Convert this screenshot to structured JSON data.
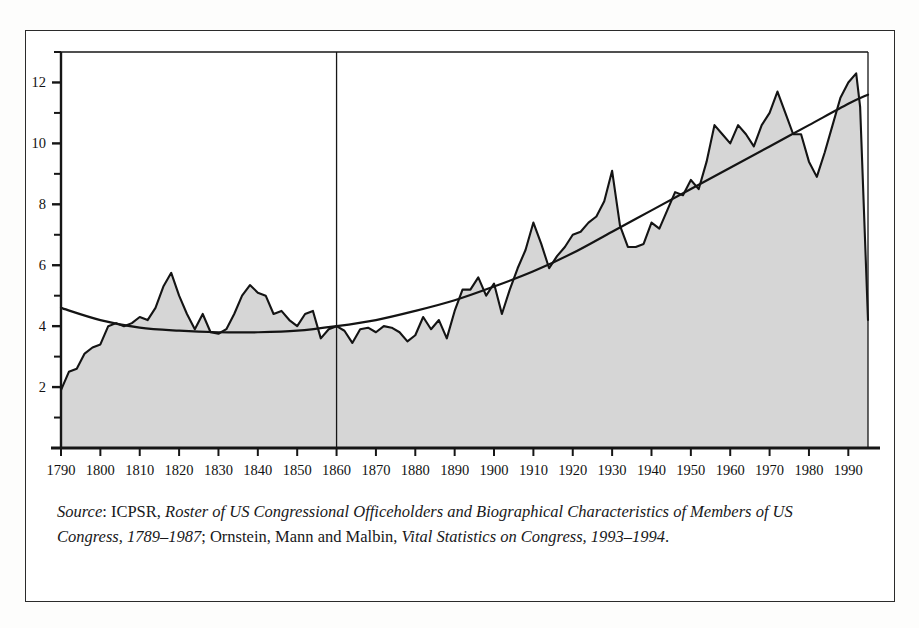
{
  "figure": {
    "caption_source_label": "Source",
    "caption_text_1": ": ICPSR, ",
    "caption_italic_1": "Roster of US Congressional Officeholders and Biographical Characteristics of Members of US Congress, 1789–1987",
    "caption_text_2": "; Ornstein, Mann and Malbin, ",
    "caption_italic_2": "Vital Statistics on Congress, 1993–1994",
    "caption_text_3": "."
  },
  "colors": {
    "area_fill": "#d6d6d6",
    "line": "#141414",
    "frame": "#2b2b2b",
    "page_background": "#ffffff"
  },
  "chart_data": {
    "type": "area",
    "title": "",
    "subtitle": "",
    "xlabel": "",
    "ylabel": "",
    "xlim": [
      1790,
      1995
    ],
    "ylim": [
      0,
      13
    ],
    "grid": false,
    "legend": "none",
    "x_ticks": [
      1790,
      1800,
      1810,
      1820,
      1830,
      1840,
      1850,
      1860,
      1870,
      1880,
      1890,
      1900,
      1910,
      1920,
      1930,
      1940,
      1950,
      1960,
      1970,
      1980,
      1990
    ],
    "x_tick_labels": [
      "1790",
      "1800",
      "1810",
      "1820",
      "1830",
      "1840",
      "1850",
      "1860",
      "1870",
      "1880",
      "1890",
      "1900",
      "1910",
      "1920",
      "1930",
      "1940",
      "1950",
      "1960",
      "1970",
      "1980",
      "1990"
    ],
    "y_ticks": [
      2,
      4,
      6,
      8,
      10,
      12
    ],
    "y_tick_labels": [
      "2",
      "4",
      "6",
      "8",
      "10",
      "12"
    ],
    "y_minor_ticks": [
      1,
      3,
      5,
      7,
      9,
      11,
      13
    ],
    "annotations": [
      {
        "type": "vertical-line",
        "x": 1860,
        "label": "1860 reference line"
      }
    ],
    "series": [
      {
        "name": "Mean years of service",
        "style": "filled-area-with-line",
        "x": [
          1790,
          1792,
          1794,
          1796,
          1798,
          1800,
          1802,
          1804,
          1806,
          1808,
          1810,
          1812,
          1814,
          1816,
          1818,
          1820,
          1822,
          1824,
          1826,
          1828,
          1830,
          1832,
          1834,
          1836,
          1838,
          1840,
          1842,
          1844,
          1846,
          1848,
          1850,
          1852,
          1854,
          1856,
          1858,
          1860,
          1862,
          1864,
          1866,
          1868,
          1870,
          1872,
          1874,
          1876,
          1878,
          1880,
          1882,
          1884,
          1886,
          1888,
          1890,
          1892,
          1894,
          1896,
          1898,
          1900,
          1902,
          1904,
          1906,
          1908,
          1910,
          1912,
          1914,
          1916,
          1918,
          1920,
          1922,
          1924,
          1926,
          1928,
          1930,
          1932,
          1934,
          1936,
          1938,
          1940,
          1942,
          1944,
          1946,
          1948,
          1950,
          1952,
          1954,
          1956,
          1958,
          1960,
          1962,
          1964,
          1966,
          1968,
          1970,
          1972,
          1974,
          1976,
          1978,
          1980,
          1982,
          1984,
          1986,
          1988,
          1990,
          1992,
          1993,
          1995
        ],
        "values": [
          1.9,
          2.5,
          2.6,
          3.1,
          3.3,
          3.4,
          4.0,
          4.1,
          4.0,
          4.1,
          4.3,
          4.2,
          4.6,
          5.3,
          5.75,
          5.0,
          4.4,
          3.9,
          4.4,
          3.8,
          3.75,
          3.9,
          4.4,
          5.0,
          5.35,
          5.1,
          5.0,
          4.4,
          4.5,
          4.2,
          4.0,
          4.4,
          4.5,
          3.6,
          3.9,
          4.0,
          3.85,
          3.45,
          3.9,
          3.95,
          3.8,
          4.0,
          3.95,
          3.8,
          3.5,
          3.7,
          4.3,
          3.9,
          4.2,
          3.6,
          4.5,
          5.2,
          5.2,
          5.6,
          5.0,
          5.4,
          4.4,
          5.2,
          5.9,
          6.5,
          7.4,
          6.7,
          5.9,
          6.3,
          6.6,
          7.0,
          7.1,
          7.4,
          7.6,
          8.1,
          9.1,
          7.3,
          6.6,
          6.6,
          6.7,
          7.4,
          7.2,
          7.8,
          8.4,
          8.3,
          8.8,
          8.5,
          9.4,
          10.6,
          10.3,
          10.0,
          10.6,
          10.3,
          9.9,
          10.6,
          11.0,
          11.7,
          11.0,
          10.3,
          10.3,
          9.4,
          8.9,
          9.7,
          10.6,
          11.5,
          12.0,
          12.3,
          11.2,
          4.2
        ]
      },
      {
        "name": "Fitted trend",
        "style": "smooth-curve",
        "x": [
          1790,
          1800,
          1810,
          1820,
          1830,
          1840,
          1850,
          1860,
          1870,
          1880,
          1890,
          1900,
          1910,
          1920,
          1930,
          1940,
          1950,
          1960,
          1970,
          1980,
          1990,
          1995
        ],
        "values": [
          4.6,
          4.2,
          3.95,
          3.85,
          3.8,
          3.8,
          3.85,
          4.0,
          4.2,
          4.5,
          4.85,
          5.3,
          5.8,
          6.4,
          7.1,
          7.8,
          8.5,
          9.2,
          9.9,
          10.6,
          11.3,
          11.6
        ]
      }
    ]
  }
}
